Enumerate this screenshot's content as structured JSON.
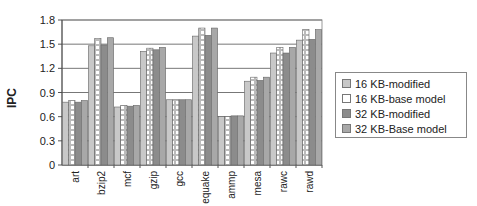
{
  "chart_data": {
    "type": "bar",
    "title": "",
    "xlabel": "",
    "ylabel": "IPC",
    "ylim": [
      0,
      1.8
    ],
    "yticks": [
      "0",
      "0.3",
      "0.6",
      "0.9",
      "1.2",
      "1.5",
      "1.8"
    ],
    "grid": true,
    "legend_position": "right",
    "categories": [
      "art",
      "bzip2",
      "mcf",
      "gzip",
      "gcc",
      "equake",
      "ammp",
      "mesa",
      "rawc",
      "rawd"
    ],
    "series": [
      {
        "name": "16 KB-modified",
        "color": "#c8c8c8",
        "values": [
          0.78,
          1.48,
          0.72,
          1.41,
          0.81,
          1.6,
          0.6,
          1.04,
          1.39,
          1.55
        ]
      },
      {
        "name": "16 KB-base model",
        "color": "#ffffff",
        "values": [
          0.8,
          1.57,
          0.74,
          1.45,
          0.81,
          1.7,
          0.6,
          1.09,
          1.46,
          1.68
        ]
      },
      {
        "name": "32 KB-modified",
        "color": "#8c8c8c",
        "values": [
          0.78,
          1.49,
          0.73,
          1.43,
          0.81,
          1.61,
          0.61,
          1.05,
          1.39,
          1.56
        ]
      },
      {
        "name": "32 KB-Base model",
        "color": "#a8a8a8",
        "values": [
          0.8,
          1.58,
          0.74,
          1.46,
          0.81,
          1.7,
          0.61,
          1.09,
          1.46,
          1.68
        ]
      }
    ]
  }
}
